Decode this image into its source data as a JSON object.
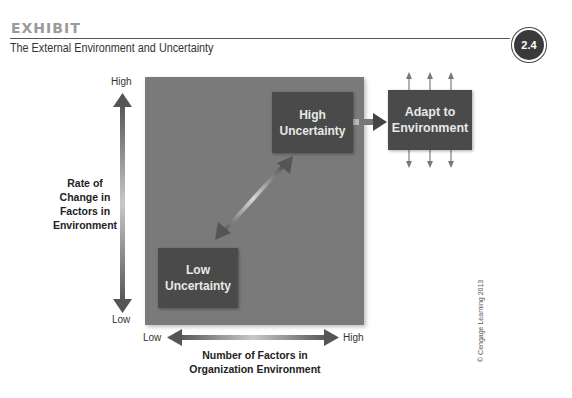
{
  "header": {
    "exhibit_label": "EXHIBIT",
    "subtitle": "The External Environment and Uncertainty",
    "exhibit_number": "2.4"
  },
  "diagram": {
    "y_axis": {
      "high_label": "High",
      "low_label": "Low",
      "title_lines": [
        "Rate of",
        "Change in",
        "Factors in",
        "Environment"
      ]
    },
    "x_axis": {
      "low_label": "Low",
      "high_label": "High",
      "title_lines": [
        "Number of Factors in",
        "Organization Environment"
      ]
    },
    "boxes": {
      "high": {
        "line1": "High",
        "line2": "Uncertainty"
      },
      "low": {
        "line1": "Low",
        "line2": "Uncertainty"
      },
      "adapt": {
        "line1": "Adapt to",
        "line2": "Environment"
      }
    },
    "colors": {
      "square": "#7a7a7a",
      "box": "#4a4a4a",
      "arrow": "#5a5a5a"
    }
  },
  "footer": {
    "copyright": "© Cengage Learning 2013"
  }
}
